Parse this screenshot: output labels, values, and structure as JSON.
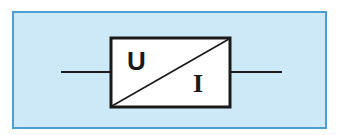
{
  "diagram": {
    "type": "converter-block",
    "input_label": "U",
    "output_label": "I",
    "colors": {
      "background": "#cde8f6",
      "frame_border": "#4a9fd0",
      "block_fill": "#ffffff",
      "stroke": "#1a1a1a"
    }
  }
}
